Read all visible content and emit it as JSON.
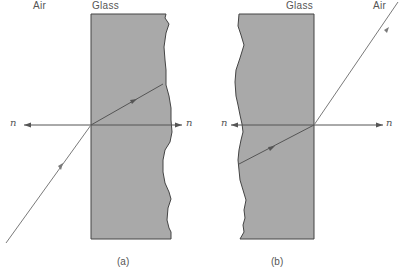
{
  "figure": {
    "panel_a": {
      "left_medium": "Air",
      "right_medium": "Glass",
      "normal_left": "n",
      "normal_right": "n",
      "caption": "(a)"
    },
    "panel_b": {
      "left_medium": "Glass",
      "right_medium": "Air",
      "normal_left": "n",
      "normal_right": "n",
      "caption": "(b)"
    }
  },
  "colors": {
    "glass_fill": "#a9a9a9",
    "outline": "#444444",
    "ray": "#7a7a7a",
    "text": "#555555"
  }
}
